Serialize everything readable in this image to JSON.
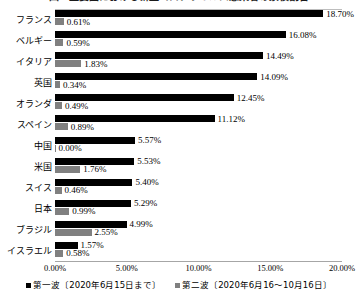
{
  "chart_data": {
    "type": "bar",
    "orientation": "horizontal",
    "title": "図1 主要国における新型コロナウイルス感染者の累積割合",
    "xlabel": "",
    "ylabel": "",
    "xlim": [
      0,
      20
    ],
    "xticks": [
      "0.00%",
      "5.00%",
      "10.00%",
      "15.00%",
      "20.00%"
    ],
    "xtick_values": [
      0,
      5,
      10,
      15,
      20
    ],
    "grid": false,
    "legend_position": "bottom",
    "categories": [
      "フランス",
      "ベルギー",
      "イタリア",
      "英国",
      "オランダ",
      "スペイン",
      "中国",
      "米国",
      "スイス",
      "日本",
      "ブラジル",
      "イスラエル"
    ],
    "series": [
      {
        "name": "第一波〔2020年6月15日まで〕",
        "color": "#000000",
        "values": [
          18.7,
          16.08,
          14.49,
          14.09,
          12.45,
          11.12,
          5.57,
          5.53,
          5.4,
          5.29,
          4.99,
          1.57
        ],
        "labels": [
          "18.70%",
          "16.08%",
          "14.49%",
          "14.09%",
          "12.45%",
          "11.12%",
          "5.57%",
          "5.53%",
          "5.40%",
          "5.29%",
          "4.99%",
          "1.57%"
        ]
      },
      {
        "name": "第二波〔2020年6月16～10月16日〕",
        "color": "#808080",
        "values": [
          0.61,
          0.59,
          1.83,
          0.34,
          0.49,
          0.89,
          0.0,
          1.76,
          0.46,
          0.99,
          2.55,
          0.58
        ],
        "labels": [
          "0.61%",
          "0.59%",
          "1.83%",
          "0.34%",
          "0.49%",
          "0.89%",
          "0.00%",
          "1.76%",
          "0.46%",
          "0.99%",
          "2.55%",
          "0.58%"
        ]
      }
    ]
  },
  "legend": {
    "items": [
      {
        "label": "第一波〔2020年6月15日まで〕",
        "color": "#000000"
      },
      {
        "label": "第二波〔2020年6月16～10月16日〕",
        "color": "#808080"
      }
    ]
  }
}
